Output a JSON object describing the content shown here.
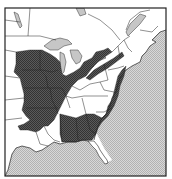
{
  "map": {
    "title": "",
    "type": "species-range-map",
    "region": "Eastern North America",
    "legend": [],
    "colors": {
      "background": "#ffffff",
      "frame": "#222222",
      "land": "#ffffff",
      "borders": "#333333",
      "water": "#d4d4d4",
      "water_pattern_dark": "#b4b4b4",
      "lakes": "#c8c8c8",
      "range": "#505050",
      "range_pattern_dark": "#3a3a3a"
    },
    "layers": [
      {
        "name": "water",
        "label": "Atlantic Ocean / Gulf of Mexico"
      },
      {
        "name": "great-lakes",
        "label": "Great Lakes"
      },
      {
        "name": "range",
        "label": "Distribution range"
      },
      {
        "name": "state-borders",
        "label": "State / province boundaries"
      }
    ]
  }
}
